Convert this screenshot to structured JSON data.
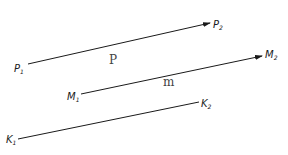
{
  "diagram": {
    "type": "parallel-line-segments",
    "colors": {
      "line": "#1a1a1a",
      "label": "#1a1a1a",
      "segment_label": "#444444",
      "background": "#ffffff"
    },
    "segments": [
      {
        "name": "P",
        "label": "P",
        "start": {
          "letter": "P",
          "sub": "1",
          "x": 28,
          "y": 64
        },
        "end": {
          "letter": "P",
          "sub": "2",
          "x": 210,
          "y": 23
        },
        "arrow": true,
        "label_pos": {
          "x": 111,
          "y": 64
        }
      },
      {
        "name": "m",
        "label": "m",
        "start": {
          "letter": "M",
          "sub": "1",
          "x": 81,
          "y": 94
        },
        "end": {
          "letter": "M",
          "sub": "2",
          "x": 262,
          "y": 56
        },
        "arrow": true,
        "label_pos": {
          "x": 163,
          "y": 87
        }
      },
      {
        "name": "K",
        "label": "",
        "start": {
          "letter": "K",
          "sub": "1",
          "x": 18,
          "y": 139
        },
        "end": {
          "letter": "K",
          "sub": "2",
          "x": 199,
          "y": 102
        },
        "arrow": false
      }
    ]
  }
}
